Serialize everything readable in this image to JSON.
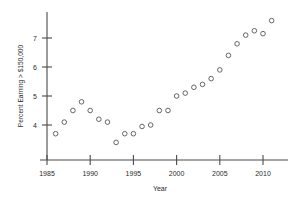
{
  "chart_data": {
    "type": "scatter",
    "title": "",
    "xlabel": "Year",
    "ylabel": "Percent Earning > $150,000",
    "xlim": [
      1985,
      2011.6
    ],
    "ylim": [
      3.2,
      7.85
    ],
    "grid": false,
    "legend": null,
    "marker": "open-circle",
    "xticks": [
      1985,
      1990,
      1995,
      2000,
      2005,
      2010
    ],
    "xtick_labels": [
      "1985",
      "1990",
      "1995",
      "2000",
      "2005",
      "2010"
    ],
    "yticks": [
      4,
      5,
      6,
      7
    ],
    "ytick_labels": [
      "4",
      "5",
      "6",
      "7"
    ],
    "x": [
      1986,
      1987,
      1988,
      1989,
      1990,
      1991,
      1992,
      1993,
      1994,
      1995,
      1996,
      1997,
      1998,
      1999,
      2000,
      2001,
      2002,
      2003,
      2004,
      2005,
      2006,
      2007,
      2008,
      2009,
      2010,
      2011
    ],
    "values": [
      3.7,
      4.1,
      4.5,
      4.8,
      4.5,
      4.2,
      4.1,
      3.4,
      3.7,
      3.7,
      3.95,
      4.0,
      4.5,
      4.5,
      5.0,
      5.1,
      5.3,
      5.4,
      5.6,
      5.9,
      6.4,
      6.8,
      7.1,
      7.25,
      7.15,
      7.6
    ],
    "points": [
      {
        "year": 1986,
        "percent": 3.7
      },
      {
        "year": 1987,
        "percent": 4.1
      },
      {
        "year": 1988,
        "percent": 4.5
      },
      {
        "year": 1989,
        "percent": 4.8
      },
      {
        "year": 1990,
        "percent": 4.5
      },
      {
        "year": 1991,
        "percent": 4.2
      },
      {
        "year": 1992,
        "percent": 4.1
      },
      {
        "year": 1993,
        "percent": 3.4
      },
      {
        "year": 1994,
        "percent": 3.7
      },
      {
        "year": 1995,
        "percent": 3.7
      },
      {
        "year": 1996,
        "percent": 3.95
      },
      {
        "year": 1997,
        "percent": 4.0
      },
      {
        "year": 1998,
        "percent": 4.5
      },
      {
        "year": 1999,
        "percent": 4.5
      },
      {
        "year": 2000,
        "percent": 5.0
      },
      {
        "year": 2001,
        "percent": 5.1
      },
      {
        "year": 2002,
        "percent": 5.3
      },
      {
        "year": 2003,
        "percent": 5.4
      },
      {
        "year": 2004,
        "percent": 5.6
      },
      {
        "year": 2005,
        "percent": 5.9
      },
      {
        "year": 2006,
        "percent": 6.4
      },
      {
        "year": 2007,
        "percent": 6.8
      },
      {
        "year": 2008,
        "percent": 7.1
      },
      {
        "year": 2009,
        "percent": 7.25
      },
      {
        "year": 2010,
        "percent": 7.15
      },
      {
        "year": 2011,
        "percent": 7.6
      }
    ],
    "colors": {
      "marker_stroke": "#55555c",
      "axis": "#4a4a4a",
      "text": "#2b2b2b",
      "background": "#ffffff"
    }
  }
}
